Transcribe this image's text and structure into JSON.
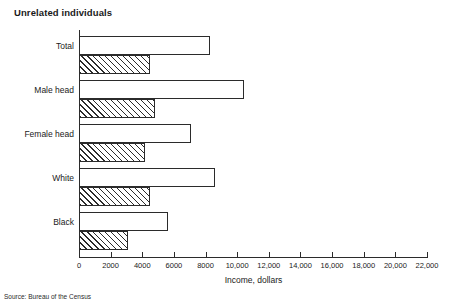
{
  "chart_data": {
    "type": "bar",
    "orientation": "horizontal",
    "title": "Unrelated individuals",
    "xlabel": "Income, dollars",
    "ylabel": "",
    "xlim": [
      0,
      22000
    ],
    "grid": false,
    "legend": null,
    "source": "Source: Bureau of the Census",
    "categories": [
      "Total",
      "Male head",
      "Female head",
      "White",
      "Black"
    ],
    "xticks": [
      0,
      2000,
      4000,
      6000,
      8000,
      10000,
      12000,
      14000,
      16000,
      18000,
      20000,
      22000
    ],
    "xticklabels": [
      "0",
      "2000",
      "4000",
      "6000",
      "8000",
      "10,000",
      "12,000",
      "14,000",
      "16,000",
      "18,000",
      "20,000",
      "22,000"
    ],
    "series": [
      {
        "name": "upper-bar",
        "style": "open",
        "values": [
          8300,
          10400,
          7100,
          8600,
          5600
        ]
      },
      {
        "name": "lower-bar",
        "style": "hatched",
        "values": [
          4500,
          4800,
          4200,
          4500,
          3100
        ]
      }
    ]
  }
}
